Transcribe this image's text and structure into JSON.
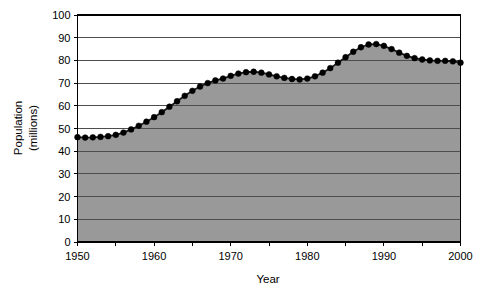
{
  "chart_data": {
    "type": "area",
    "title": "",
    "xlabel": "Year",
    "ylabel": "Population (millions)",
    "ylabel_line1": "Population",
    "ylabel_line2": "(millions)",
    "xlim": [
      1950,
      2000
    ],
    "ylim": [
      0,
      100
    ],
    "ytick_labels": [
      "0",
      "10",
      "20",
      "30",
      "40",
      "50",
      "60",
      "70",
      "80",
      "90",
      "100"
    ],
    "ytick_values": [
      0,
      10,
      20,
      30,
      40,
      50,
      60,
      70,
      80,
      90,
      100
    ],
    "xtick_labels": [
      "1950",
      "1960",
      "1970",
      "1980",
      "1990",
      "2000"
    ],
    "xtick_values": [
      1950,
      1960,
      1970,
      1980,
      1990,
      2000
    ],
    "grid": true,
    "grid_axis": "y",
    "legend": "none",
    "markers": "filled-circle",
    "series_name": "Population",
    "colors": {
      "area_fill": "#999999",
      "line": "#1a1a1a",
      "marker": "#000000",
      "grid": "#4d4d4d",
      "axis": "#000000",
      "background": "#ffffff"
    },
    "x": [
      1950,
      1951,
      1952,
      1953,
      1954,
      1955,
      1956,
      1957,
      1958,
      1959,
      1960,
      1961,
      1962,
      1963,
      1964,
      1965,
      1966,
      1967,
      1968,
      1969,
      1970,
      1971,
      1972,
      1973,
      1974,
      1975,
      1976,
      1977,
      1978,
      1979,
      1980,
      1981,
      1982,
      1983,
      1984,
      1985,
      1986,
      1987,
      1988,
      1989,
      1990,
      1991,
      1992,
      1993,
      1994,
      1995,
      1996,
      1997,
      1998,
      1999,
      2000
    ],
    "values": [
      46.2,
      46.0,
      46.1,
      46.3,
      46.6,
      47.2,
      48.2,
      49.6,
      51.2,
      53.0,
      55.0,
      57.2,
      59.6,
      62.0,
      64.4,
      66.6,
      68.5,
      70.0,
      71.2,
      72.0,
      73.2,
      74.2,
      74.8,
      75.0,
      74.6,
      73.8,
      73.0,
      72.3,
      71.8,
      71.6,
      72.0,
      73.0,
      74.6,
      76.6,
      79.0,
      81.4,
      83.8,
      85.8,
      87.0,
      87.2,
      86.4,
      85.0,
      83.4,
      82.0,
      81.0,
      80.4,
      80.0,
      79.8,
      79.8,
      79.6,
      79.0
    ]
  }
}
